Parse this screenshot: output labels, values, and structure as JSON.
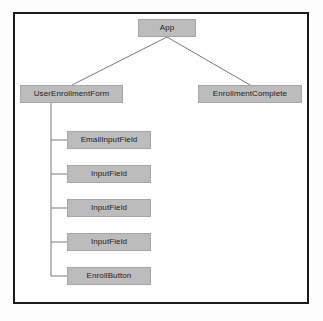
{
  "diagram": {
    "type": "component-tree",
    "background_color": "#ffffff",
    "frame_border_color": "#1b1b1b",
    "node_fill_color": "#bcbcbc",
    "node_border_color": "#a6a6a6",
    "edge_color": "#7a7a7a",
    "text_color": "#1c1c1c",
    "nodes": [
      {
        "id": "app",
        "label": "App",
        "x": 138,
        "y": 19,
        "w": 58,
        "h": 18
      },
      {
        "id": "user-enrollment",
        "label": "UserEnrollmentForm",
        "x": 20,
        "y": 85,
        "w": 103,
        "h": 18
      },
      {
        "id": "enrollment-done",
        "label": "EnrollmentComplete",
        "x": 198,
        "y": 85,
        "w": 104,
        "h": 18
      },
      {
        "id": "email-input-field",
        "label": "EmailInputField",
        "x": 67,
        "y": 131,
        "w": 84,
        "h": 18
      },
      {
        "id": "input-field-1",
        "label": "InputField",
        "x": 67,
        "y": 165,
        "w": 84,
        "h": 18
      },
      {
        "id": "input-field-2",
        "label": "InputField",
        "x": 67,
        "y": 199,
        "w": 84,
        "h": 18
      },
      {
        "id": "input-field-3",
        "label": "InputField",
        "x": 67,
        "y": 233,
        "w": 84,
        "h": 18
      },
      {
        "id": "enroll-button",
        "label": "EnrollButton",
        "x": 67,
        "y": 267,
        "w": 84,
        "h": 18
      }
    ],
    "edges": [
      {
        "from": "app",
        "to": "user-enrollment",
        "style": "diagonal"
      },
      {
        "from": "app",
        "to": "enrollment-done",
        "style": "diagonal"
      },
      {
        "from": "user-enrollment",
        "to": "email-input-field",
        "style": "elbow"
      },
      {
        "from": "user-enrollment",
        "to": "input-field-1",
        "style": "elbow"
      },
      {
        "from": "user-enrollment",
        "to": "input-field-2",
        "style": "elbow"
      },
      {
        "from": "user-enrollment",
        "to": "input-field-3",
        "style": "elbow"
      },
      {
        "from": "user-enrollment",
        "to": "enroll-button",
        "style": "elbow"
      }
    ]
  }
}
